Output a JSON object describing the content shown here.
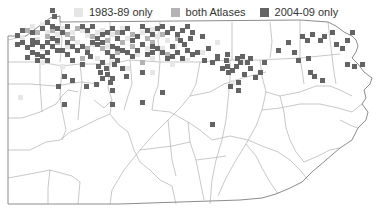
{
  "legend": {
    "items": [
      {
        "label": "1983-89 only",
        "color": "#e6e6e6"
      },
      {
        "label": "both Atlases",
        "color": "#b3b3b3"
      },
      {
        "label": "2004-09 only",
        "color": "#646464"
      }
    ]
  },
  "map": {
    "region": "Pennsylvania counties",
    "outline_color": "#999999",
    "county_line_color": "#aaaaaa",
    "block_size": 5,
    "blocks": {
      "early": [
        [
          30,
          24
        ],
        [
          40,
          22
        ],
        [
          45,
          30
        ],
        [
          55,
          32
        ],
        [
          60,
          26
        ],
        [
          70,
          30
        ],
        [
          80,
          28
        ],
        [
          85,
          33
        ],
        [
          95,
          30
        ],
        [
          100,
          28
        ],
        [
          110,
          32
        ],
        [
          120,
          26
        ],
        [
          125,
          36
        ],
        [
          140,
          30
        ],
        [
          150,
          27
        ],
        [
          155,
          34
        ],
        [
          165,
          38
        ],
        [
          20,
          35
        ],
        [
          35,
          37
        ],
        [
          75,
          40
        ],
        [
          90,
          42
        ],
        [
          105,
          44
        ],
        [
          145,
          46
        ],
        [
          160,
          46
        ],
        [
          172,
          44
        ],
        [
          135,
          52
        ],
        [
          150,
          56
        ],
        [
          40,
          60
        ],
        [
          60,
          64
        ],
        [
          110,
          60
        ],
        [
          125,
          66
        ],
        [
          200,
          50
        ],
        [
          215,
          40
        ],
        [
          185,
          58
        ],
        [
          170,
          62
        ],
        [
          240,
          60
        ],
        [
          230,
          80
        ],
        [
          150,
          70
        ],
        [
          18,
          95
        ],
        [
          40,
          46
        ],
        [
          65,
          44
        ],
        [
          95,
          56
        ]
      ],
      "both": [
        [
          25,
          28
        ],
        [
          35,
          30
        ],
        [
          50,
          28
        ],
        [
          65,
          32
        ],
        [
          75,
          26
        ],
        [
          90,
          34
        ],
        [
          115,
          30
        ],
        [
          130,
          32
        ],
        [
          145,
          36
        ],
        [
          160,
          32
        ],
        [
          105,
          38
        ],
        [
          120,
          40
        ],
        [
          70,
          36
        ],
        [
          55,
          40
        ],
        [
          85,
          46
        ],
        [
          130,
          44
        ],
        [
          150,
          40
        ],
        [
          165,
          52
        ],
        [
          140,
          60
        ],
        [
          175,
          36
        ],
        [
          45,
          34
        ],
        [
          100,
          46
        ],
        [
          80,
          56
        ],
        [
          115,
          50
        ]
      ],
      "late": [
        [
          50,
          8
        ],
        [
          52,
          14
        ],
        [
          45,
          20
        ],
        [
          40,
          26
        ],
        [
          15,
          33
        ],
        [
          20,
          28
        ],
        [
          30,
          30
        ],
        [
          50,
          24
        ],
        [
          55,
          26
        ],
        [
          60,
          30
        ],
        [
          65,
          24
        ],
        [
          80,
          24
        ],
        [
          85,
          28
        ],
        [
          90,
          24
        ],
        [
          95,
          36
        ],
        [
          100,
          32
        ],
        [
          105,
          30
        ],
        [
          110,
          26
        ],
        [
          115,
          36
        ],
        [
          120,
          30
        ],
        [
          125,
          26
        ],
        [
          130,
          38
        ],
        [
          135,
          34
        ],
        [
          140,
          24
        ],
        [
          145,
          28
        ],
        [
          150,
          32
        ],
        [
          155,
          26
        ],
        [
          160,
          24
        ],
        [
          165,
          30
        ],
        [
          170,
          26
        ],
        [
          175,
          32
        ],
        [
          180,
          28
        ],
        [
          185,
          24
        ],
        [
          190,
          30
        ],
        [
          178,
          38
        ],
        [
          182,
          42
        ],
        [
          188,
          36
        ],
        [
          15,
          42
        ],
        [
          20,
          40
        ],
        [
          25,
          45
        ],
        [
          30,
          42
        ],
        [
          35,
          40
        ],
        [
          40,
          44
        ],
        [
          45,
          40
        ],
        [
          50,
          44
        ],
        [
          55,
          48
        ],
        [
          30,
          50
        ],
        [
          35,
          52
        ],
        [
          40,
          54
        ],
        [
          45,
          50
        ],
        [
          60,
          48
        ],
        [
          65,
          52
        ],
        [
          25,
          55
        ],
        [
          35,
          58
        ],
        [
          45,
          58
        ],
        [
          30,
          38
        ],
        [
          50,
          36
        ],
        [
          55,
          38
        ],
        [
          65,
          40
        ],
        [
          70,
          44
        ],
        [
          75,
          48
        ],
        [
          80,
          44
        ],
        [
          85,
          50
        ],
        [
          90,
          40
        ],
        [
          95,
          42
        ],
        [
          100,
          40
        ],
        [
          105,
          50
        ],
        [
          110,
          44
        ],
        [
          115,
          46
        ],
        [
          120,
          48
        ],
        [
          125,
          50
        ],
        [
          130,
          54
        ],
        [
          135,
          48
        ],
        [
          140,
          42
        ],
        [
          145,
          52
        ],
        [
          150,
          50
        ],
        [
          155,
          46
        ],
        [
          160,
          50
        ],
        [
          165,
          56
        ],
        [
          170,
          54
        ],
        [
          175,
          50
        ],
        [
          180,
          56
        ],
        [
          185,
          48
        ],
        [
          190,
          52
        ],
        [
          195,
          50
        ],
        [
          170,
          44
        ],
        [
          150,
          44
        ],
        [
          110,
          54
        ],
        [
          115,
          58
        ],
        [
          88,
          54
        ],
        [
          70,
          58
        ],
        [
          80,
          62
        ],
        [
          100,
          60
        ],
        [
          112,
          62
        ],
        [
          120,
          66
        ],
        [
          104,
          66
        ],
        [
          96,
          64
        ],
        [
          98,
          70
        ],
        [
          105,
          72
        ],
        [
          110,
          76
        ],
        [
          100,
          76
        ],
        [
          108,
          80
        ],
        [
          62,
          74
        ],
        [
          70,
          78
        ],
        [
          56,
          84
        ],
        [
          84,
          84
        ],
        [
          94,
          82
        ],
        [
          110,
          88
        ],
        [
          62,
          102
        ],
        [
          110,
          102
        ],
        [
          140,
          70
        ],
        [
          124,
          74
        ],
        [
          160,
          90
        ],
        [
          140,
          100
        ],
        [
          200,
          34
        ],
        [
          206,
          46
        ],
        [
          215,
          54
        ],
        [
          225,
          52
        ],
        [
          210,
          60
        ],
        [
          235,
          56
        ],
        [
          240,
          54
        ],
        [
          245,
          60
        ],
        [
          225,
          64
        ],
        [
          230,
          68
        ],
        [
          234,
          64
        ],
        [
          226,
          70
        ],
        [
          242,
          72
        ],
        [
          248,
          66
        ],
        [
          236,
          80
        ],
        [
          253,
          75
        ],
        [
          258,
          70
        ],
        [
          248,
          56
        ],
        [
          224,
          58
        ],
        [
          220,
          66
        ],
        [
          238,
          60
        ],
        [
          215,
          56
        ],
        [
          202,
          58
        ],
        [
          286,
          40
        ],
        [
          300,
          34
        ],
        [
          305,
          38
        ],
        [
          310,
          32
        ],
        [
          318,
          38
        ],
        [
          322,
          34
        ],
        [
          330,
          30
        ],
        [
          334,
          42
        ],
        [
          340,
          46
        ],
        [
          345,
          38
        ],
        [
          350,
          30
        ],
        [
          296,
          58
        ],
        [
          306,
          56
        ],
        [
          276,
          48
        ],
        [
          308,
          70
        ],
        [
          312,
          74
        ],
        [
          345,
          62
        ],
        [
          352,
          64
        ],
        [
          360,
          62
        ],
        [
          320,
          78
        ],
        [
          228,
          84
        ],
        [
          210,
          122
        ],
        [
          236,
          88
        ],
        [
          262,
          60
        ],
        [
          292,
          50
        ]
      ]
    },
    "outline": "M26,36 L50,18 L60,16 L60,22 L300,20 L328,22 L336,26 L344,32 L352,36 L356,40 L358,46 L356,52 L352,58 L358,64 L364,72 L372,78 L370,84 L364,90 L366,98 L362,104 L368,112 L366,120 L358,128 L352,140 L340,148 L326,160 L312,172 L302,182 L290,188 L276,194 L262,198 L240,200 L180,202 L120,204 L60,204 L8,204 L8,36 Z",
    "counties": [
      "M8,62 L40,62 L62,66 L80,64 L110,64 L130,60 L160,62 L200,62 L230,60 L260,60 L300,58",
      "M8,84 L30,84 L56,86 L80,82 L100,84",
      "M8,118 L22,118 L40,112 L56,104 L62,96 L68,90 L78,92",
      "M8,150 L30,150 L46,142 L60,140 L70,132 L80,128 L96,120 L110,114",
      "M8,178 L30,174 L50,170 L72,176 L80,182",
      "M40,62 L40,84 L42,112",
      "M62,66 L60,96 L62,110 L66,130 L62,140",
      "M80,64 L82,82 L80,96 L78,120",
      "M110,64 L108,88 L112,100 L110,114 L118,124 L128,132 L134,150",
      "M130,60 L132,84 L128,96 L124,110",
      "M160,62 L158,86 L154,96 L152,110",
      "M200,62 L196,84 L190,96 L180,108 L168,120 L154,134 L140,150 L124,170 L112,190 L110,204",
      "M50,170 L48,188 L48,204",
      "M80,182 L78,204",
      "M134,150 L140,162 L150,170 L160,180 L172,186 L176,204",
      "M152,110 L170,112 L188,122 L200,130 L212,140",
      "M190,96 L210,92 L224,84 L236,80 L250,76 L266,72",
      "M230,60 L230,80 L228,100 L226,120 L222,140 L216,160 L212,180 L210,204",
      "M260,60 L262,76 L266,92 L280,96 L300,92 L316,86 L330,86 L340,90 L352,96",
      "M300,20 L300,58 L302,70 L304,84",
      "M300,58 L320,56 L340,54",
      "M328,22 L330,40 L332,56 L334,72 L336,84",
      "M266,92 L262,110 L256,126 L246,144 L236,160 L226,178 L218,196",
      "M212,140 L230,136 L248,140 L262,146 L278,152 L290,160 L300,170 L308,180",
      "M280,96 L284,112 L286,128 L290,140 L296,152 L304,162",
      "M246,144 L256,156 L262,168 L270,182 L278,194",
      "M262,110 L280,108 L300,104 L320,104 L338,108 L352,112 L362,104",
      "M304,162 L318,156 L330,150 L340,148",
      "M168,120 L170,140 L172,160 L176,176",
      "M188,122 L190,142 L196,160 L200,180 L204,200",
      "M140,150 L156,148 L172,146 L190,142",
      "M196,160 L212,158 L226,156",
      "M26,36 L8,40",
      "M60,22 L62,40 L60,62",
      "M110,22 L110,64",
      "M160,22 L158,40 L160,62",
      "M232,22 L232,60",
      "M270,22 L272,42 L270,58",
      "M94,100 L104,108 L112,100",
      "M340,120 L352,126 L358,128"
    ]
  }
}
